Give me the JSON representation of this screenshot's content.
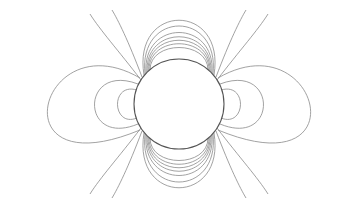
{
  "diagram": {
    "type": "field-lines",
    "colors": {
      "background": "#ffffff",
      "lines": "#8a8a8a",
      "circle": "#555555"
    },
    "circle": {
      "cx": 179,
      "cy": 104,
      "r": 45
    },
    "side_loops_rx": [
      13,
      34,
      91
    ],
    "vertical_lobe_count": 10
  }
}
